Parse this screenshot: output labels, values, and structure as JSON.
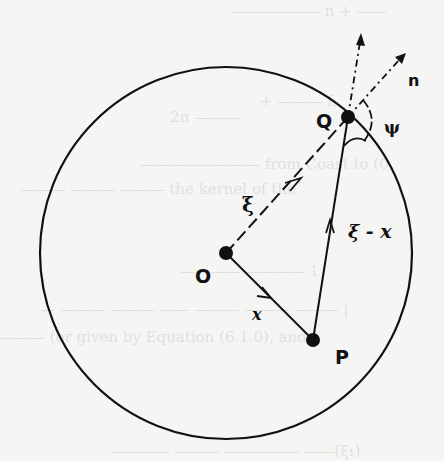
{
  "figure": {
    "type": "geometric-diagram",
    "colors": {
      "ink": "#111111",
      "background": "#f5f5f3"
    },
    "circle": {
      "cx": 226,
      "cy": 253,
      "r": 186
    },
    "points": {
      "O": {
        "label": "O",
        "x": 226,
        "y": 253
      },
      "P": {
        "label": "P",
        "x": 313,
        "y": 340
      },
      "Q": {
        "label": "Q",
        "x": 348,
        "y": 117
      }
    },
    "vectors": {
      "xi": {
        "label": "ξ",
        "from": "O",
        "to": "Q",
        "style": "dashed"
      },
      "x": {
        "label": "x",
        "from": "O",
        "to": "P",
        "style": "solid"
      },
      "xi_minus_x": {
        "label": "ξ - x",
        "from": "P",
        "to": "Q",
        "style": "solid"
      },
      "n": {
        "label": "n",
        "from": "Q",
        "style": "dash-dot",
        "meaning": "outward normal"
      },
      "extension": {
        "from": "Q",
        "style": "dash-dot",
        "meaning": "extension of P→Q direction"
      }
    },
    "angle": {
      "label": "ψ",
      "at": "Q"
    }
  },
  "labels": {
    "O": "O",
    "P": "P",
    "Q": "Q",
    "n": "n",
    "xi": "ξ",
    "x": "x",
    "xi_minus_x": "ξ - x",
    "psi": "ψ"
  }
}
